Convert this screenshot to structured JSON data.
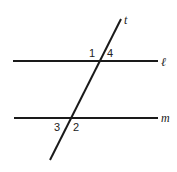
{
  "diagram": {
    "type": "parallel-lines-transversal",
    "line_color": "#1a1a1a",
    "lines": {
      "l": {
        "label": "ℓ",
        "x1": 13,
        "y1": 61,
        "x2": 158,
        "y2": 61
      },
      "m": {
        "label": "m",
        "x1": 14,
        "y1": 118,
        "x2": 158,
        "y2": 118
      },
      "t": {
        "label": "t",
        "x1": 121,
        "y1": 19,
        "x2": 50,
        "y2": 160
      }
    },
    "angles": {
      "a1": "1",
      "a2": "2",
      "a3": "3",
      "a4": "4"
    }
  }
}
